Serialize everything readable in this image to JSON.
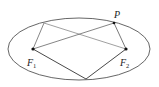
{
  "diagram": {
    "type": "ellipse-foci",
    "ellipse": {
      "cx": 79,
      "cy": 49,
      "rx": 71,
      "ry": 31,
      "stroke": "#555555"
    },
    "points": {
      "F1": {
        "x": 33,
        "y": 49,
        "label": "F",
        "subscript": "1"
      },
      "F2": {
        "x": 126,
        "y": 49,
        "label": "F",
        "subscript": "2"
      },
      "P": {
        "x": 114,
        "y": 23,
        "label": "P"
      },
      "Q": {
        "x": 44,
        "y": 23
      },
      "B": {
        "x": 86,
        "y": 79
      }
    },
    "segments": [
      [
        "Q",
        "F1"
      ],
      [
        "Q",
        "F2"
      ],
      [
        "F1",
        "P"
      ],
      [
        "P",
        "F2"
      ],
      [
        "F1",
        "B"
      ],
      [
        "B",
        "F2"
      ]
    ],
    "labels": {
      "p": "P",
      "f1_main": "F",
      "f1_sub": "1",
      "f2_main": "F",
      "f2_sub": "2"
    }
  }
}
